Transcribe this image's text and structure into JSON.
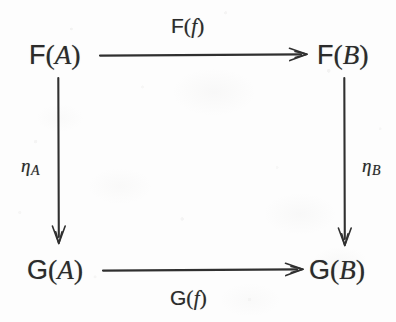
{
  "diagram": {
    "kind": "commutative-diagram",
    "background_color": "#fdfdfd",
    "ink_color": "#2b2b2b",
    "width": 396,
    "height": 322,
    "vertices": [
      {
        "id": "FA",
        "functor": "F",
        "open_paren": "(",
        "argument": "A",
        "close_paren": ")",
        "position": "top-left"
      },
      {
        "id": "FB",
        "functor": "F",
        "open_paren": "(",
        "argument": "B",
        "close_paren": ")",
        "position": "top-right"
      },
      {
        "id": "GA",
        "functor": "G",
        "open_paren": "(",
        "argument": "A",
        "close_paren": ")",
        "position": "bottom-left"
      },
      {
        "id": "GB",
        "functor": "G",
        "open_paren": "(",
        "argument": "B",
        "close_paren": ")",
        "position": "bottom-right"
      }
    ],
    "arrows": [
      {
        "id": "top",
        "from": "FA",
        "to": "FB",
        "direction": "right",
        "label": {
          "functor": "F",
          "open_paren": "(",
          "argument": "f",
          "close_paren": ")"
        },
        "label_position": "above"
      },
      {
        "id": "bottom",
        "from": "GA",
        "to": "GB",
        "direction": "right",
        "label": {
          "functor": "G",
          "open_paren": "(",
          "argument": "f",
          "close_paren": ")"
        },
        "label_position": "below"
      },
      {
        "id": "left",
        "from": "FA",
        "to": "GA",
        "direction": "down",
        "label": {
          "symbol": "η",
          "subscript": "A"
        },
        "label_position": "left"
      },
      {
        "id": "right",
        "from": "FB",
        "to": "GB",
        "direction": "down",
        "label": {
          "symbol": "η",
          "subscript": "B"
        },
        "label_position": "right"
      }
    ]
  }
}
